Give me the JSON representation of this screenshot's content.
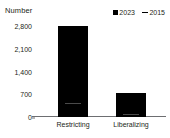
{
  "chart_data": {
    "type": "bar",
    "title": "",
    "subtitle": "",
    "xlabel": "",
    "ylabel": "Number",
    "categories": [
      "Restricting",
      "Liberalizing"
    ],
    "series": [
      {
        "name": "2023",
        "marker": "filled-square",
        "values": [
          2800,
          730
        ]
      },
      {
        "name": "2015",
        "marker": "line-dash",
        "values": [
          390,
          230
        ]
      }
    ],
    "ylim": [
      0,
      2800
    ],
    "yticks": [
      0,
      700,
      1400,
      2100,
      2800
    ],
    "ytick_labels": [
      "0",
      "700",
      "1,400",
      "2,100",
      "2,800"
    ],
    "grid": false,
    "legend_position": "top-right"
  },
  "axis": {
    "y_title": "Number",
    "ticks": [
      {
        "label": "2,800",
        "value": 2800
      },
      {
        "label": "2,100",
        "value": 2100
      },
      {
        "label": "1,400",
        "value": 1400
      },
      {
        "label": "700",
        "value": 700
      },
      {
        "label": "0",
        "value": 0
      }
    ]
  },
  "legend": {
    "items": [
      {
        "label": "2023",
        "marker": "filled-square"
      },
      {
        "label": "2015",
        "marker": "line-dash"
      }
    ]
  },
  "bars": [
    {
      "category": "Restricting",
      "value_2023": 2800,
      "value_2015": 390
    },
    {
      "category": "Liberalizing",
      "value_2023": 730,
      "value_2015": 230
    }
  ],
  "colors": {
    "series_2023": "#000000",
    "series_2015": "#4a4a4a",
    "axis": "#6d6e71",
    "text": "#231f20",
    "background": "#ffffff"
  }
}
